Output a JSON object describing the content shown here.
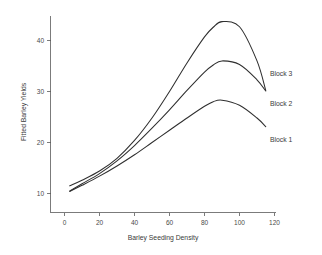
{
  "chart_data": {
    "type": "line",
    "title": "",
    "xlabel": "Barley Seeding Density",
    "ylabel": "Fitted Barley Yields",
    "xlim": [
      -4,
      126
    ],
    "ylim": [
      7.5,
      45.5
    ],
    "xticks": [
      0,
      20,
      40,
      60,
      80,
      100,
      120
    ],
    "xtick_labels": [
      "0",
      "20",
      "40",
      "60",
      "80",
      "100",
      "120"
    ],
    "yticks": [
      10,
      20,
      30,
      40
    ],
    "ytick_labels": [
      "10",
      "20",
      "30",
      "40"
    ],
    "grid": false,
    "legend_position": "inline-right-of-curve-ends",
    "series": [
      {
        "name": "Block 1",
        "label": "Block 1",
        "color": "#2f2f2f",
        "x": [
          3,
          10,
          20,
          30,
          40,
          50,
          60,
          70,
          80,
          85,
          90,
          100,
          110,
          115
        ],
        "y": [
          10.4,
          11.6,
          13.4,
          15.4,
          17.6,
          20.0,
          22.4,
          24.8,
          27.1,
          28.0,
          28.3,
          27.3,
          24.8,
          23.1
        ]
      },
      {
        "name": "Block 2",
        "label": "Block 2",
        "color": "#2f2f2f",
        "x": [
          3,
          10,
          20,
          30,
          40,
          50,
          60,
          70,
          80,
          85,
          90,
          100,
          110,
          115
        ],
        "y": [
          10.5,
          11.9,
          13.9,
          16.4,
          19.4,
          22.8,
          26.4,
          30.2,
          33.8,
          35.2,
          36.0,
          35.3,
          32.3,
          30.1
        ]
      },
      {
        "name": "Block 3",
        "label": "Block 3",
        "color": "#2f2f2f",
        "x": [
          3,
          10,
          20,
          30,
          40,
          50,
          60,
          70,
          80,
          85,
          90,
          100,
          110,
          115
        ],
        "y": [
          11.5,
          12.6,
          14.4,
          16.9,
          20.4,
          24.8,
          30.0,
          35.6,
          40.7,
          42.6,
          43.7,
          42.7,
          36.0,
          30.2
        ]
      }
    ]
  },
  "labels": {
    "block1": "Block 1",
    "block2": "Block 2",
    "block3": "Block 3",
    "xaxis_title": "Barley Seeding Density",
    "yaxis_title": "Fitted Barley Yields",
    "x_0": "0",
    "x_20": "20",
    "x_40": "40",
    "x_60": "60",
    "x_80": "80",
    "x_100": "100",
    "x_120": "120",
    "y_10": "10",
    "y_20": "20",
    "y_30": "30",
    "y_40": "40"
  }
}
